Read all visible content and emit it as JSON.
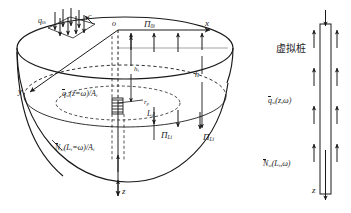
{
  "figure": {
    "type": "engineering-schematic"
  },
  "axes": {
    "origin": "o",
    "x_label": "x",
    "y_label": "y",
    "z_label": "z"
  },
  "labels": {
    "surface_load": "q",
    "surface_load_sub": "0i",
    "corner_c": "c",
    "pi_0i_base": "Π",
    "pi_0i_sub": "0i",
    "pi_Li_base": "Π",
    "pi_Li_sub": "Li",
    "pi_Li2_base": "Π",
    "pi_Li2_sub": "Li",
    "h_i_base": "h",
    "h_i_sub": "i",
    "h_base": "h",
    "r_p_base": "r",
    "r_p_sub": "p",
    "L_i_base": "L",
    "L_i_sub": "i",
    "q_si_left": "q",
    "q_si_left_sub": "si",
    "q_si_left_tail": "(z=ω)/A",
    "q_si_left_tail_sub": "i",
    "N_si_left": "N",
    "N_si_left_sub": "si",
    "N_si_left_tail": "(L",
    "N_si_left_tail_sub": "i",
    "N_si_left_tail2": "=ω)/A",
    "N_si_left_tail2_sub": "i",
    "virtual_pile": "虚拟桩",
    "q_si_right": "q",
    "q_si_right_sub": "si",
    "q_si_right_tail": "(z,ω)",
    "N_si_right": "N",
    "N_si_right_sub": "si",
    "N_si_right_tail": "(L",
    "N_si_right_tail_sub": "i",
    "N_si_right_tail2": ",ω)",
    "z_right": "z"
  },
  "colors": {
    "stroke": "#1a1a1a",
    "background": "#ffffff"
  }
}
